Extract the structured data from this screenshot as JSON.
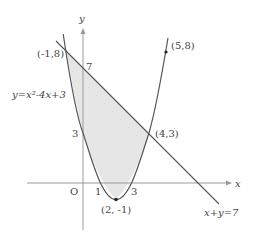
{
  "diagram": {
    "type": "coordinate-plane-region",
    "axes": {
      "x_label": "x",
      "y_label": "y",
      "origin_label": "O"
    },
    "curve": {
      "label": "y=x²-4x+3",
      "expression": "y = x^2 - 4x + 3",
      "vertex_label": "(2, -1)",
      "y_intercept_label": "3",
      "x_intercepts": [
        "1",
        "3"
      ]
    },
    "line": {
      "label": "x+y=7",
      "expression": "x + y = 7",
      "y_intercept_label": "7"
    },
    "points": [
      {
        "label": "(-1,8)",
        "x": -1,
        "y": 8
      },
      {
        "label": "(5,8)",
        "x": 5,
        "y": 8
      },
      {
        "label": "(4,3)",
        "x": 4,
        "y": 3
      },
      {
        "label": "(2, -1)",
        "x": 2,
        "y": -1
      }
    ],
    "shaded_region": "between y=x²-4x+3 and x+y=7 for -1 ≤ x ≤ 4",
    "colors": {
      "axis": "#9a9a9a",
      "curve": "#555555",
      "shade": "#e6e6e6"
    }
  }
}
